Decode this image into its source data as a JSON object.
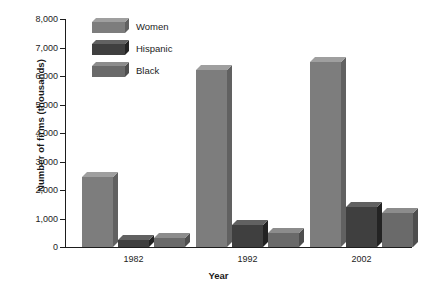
{
  "chart_data": {
    "type": "bar",
    "title": "",
    "subtitle": "",
    "xlabel": "Year",
    "ylabel": "Number of firms (thousands)",
    "categories": [
      "1982",
      "1992",
      "2002"
    ],
    "series": [
      {
        "name": "Women",
        "values": [
          2450,
          6200,
          6500
        ],
        "color": "#7d7d7d"
      },
      {
        "name": "Hispanic",
        "values": [
          250,
          770,
          1400
        ],
        "color": "#3f3f3f"
      },
      {
        "name": "Black",
        "values": [
          300,
          480,
          1200
        ],
        "color": "#6a6a6a"
      }
    ],
    "ylim": [
      0,
      8000
    ],
    "yticks": [
      "0",
      "1,000",
      "2,000",
      "3,000",
      "4,000",
      "5,000",
      "6,000",
      "7,000",
      "8,000"
    ],
    "ytick_values": [
      0,
      1000,
      2000,
      3000,
      4000,
      5000,
      6000,
      7000,
      8000
    ],
    "grid": false,
    "legend_position": "top-left",
    "style": "3d-bars"
  },
  "axis": {
    "y_title": "Number of firms (thousands)",
    "x_title": "Year"
  },
  "legend": {
    "items": [
      {
        "label": "Women"
      },
      {
        "label": "Hispanic"
      },
      {
        "label": "Black"
      }
    ]
  }
}
